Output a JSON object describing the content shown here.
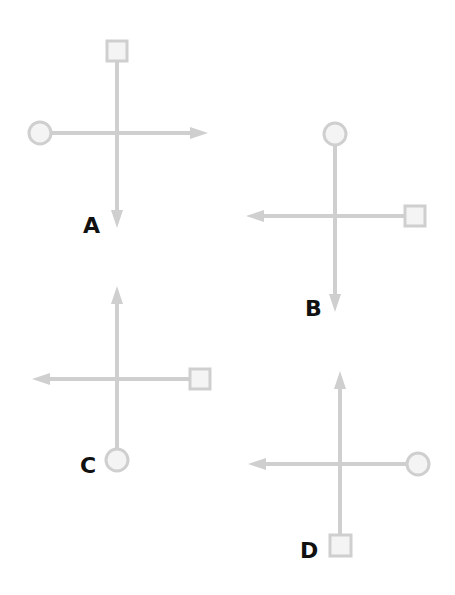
{
  "colors": {
    "line": "#cfcfcf",
    "shape_fill": "#f4f4f4",
    "label": "#111111",
    "background": "#ffffff"
  },
  "figures": [
    {
      "label": "A",
      "vertical": {
        "top": "square",
        "bottom": "arrow-down"
      },
      "horizontal": {
        "left": "circle",
        "right": "arrow-right"
      }
    },
    {
      "label": "B",
      "vertical": {
        "top": "circle",
        "bottom": "arrow-down"
      },
      "horizontal": {
        "left": "arrow-left",
        "right": "square"
      }
    },
    {
      "label": "C",
      "vertical": {
        "top": "arrow-up",
        "bottom": "circle"
      },
      "horizontal": {
        "left": "arrow-left",
        "right": "square"
      }
    },
    {
      "label": "D",
      "vertical": {
        "top": "arrow-up",
        "bottom": "square"
      },
      "horizontal": {
        "left": "arrow-left",
        "right": "circle"
      }
    }
  ]
}
